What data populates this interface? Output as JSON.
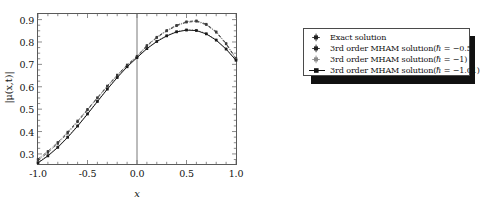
{
  "chart_data": {
    "type": "line",
    "title": "",
    "xlabel": "x",
    "ylabel": "|μ(x,t)|",
    "xlim": [
      -1.0,
      1.0
    ],
    "ylim": [
      0.255,
      0.925
    ],
    "grid": false,
    "legend_position": "right-outside",
    "x_ticks": [
      "-1.0",
      "-0.5",
      "0.0",
      "0.5",
      "1.0"
    ],
    "x_tick_values": [
      -1.0,
      -0.5,
      0.0,
      0.5,
      1.0
    ],
    "y_ticks": [
      "0.3",
      "0.4",
      "0.5",
      "0.6",
      "0.7",
      "0.8",
      "0.9"
    ],
    "y_tick_values": [
      0.3,
      0.4,
      0.5,
      0.6,
      0.7,
      0.8,
      0.9
    ],
    "x": [
      -1.0,
      -0.9,
      -0.8,
      -0.7,
      -0.6,
      -0.5,
      -0.4,
      -0.3,
      -0.2,
      -0.1,
      0.0,
      0.1,
      0.2,
      0.3,
      0.4,
      0.5,
      0.6,
      0.7,
      0.8,
      0.9,
      1.0
    ],
    "series": [
      {
        "name": "Exact solution",
        "marker": "square",
        "line": "dash-dot",
        "color": "#3c3c3c",
        "values": [
          0.277,
          0.312,
          0.352,
          0.398,
          0.448,
          0.5,
          0.552,
          0.604,
          0.653,
          0.698,
          0.737,
          0.785,
          0.822,
          0.852,
          0.875,
          0.891,
          0.895,
          0.88,
          0.846,
          0.794,
          0.727
        ]
      },
      {
        "name": "3rd order MHAM solution(ℏ = −0.5)",
        "marker": "square",
        "line": "dash-dot",
        "color": "#3c3c3c",
        "values": [
          0.271,
          0.306,
          0.346,
          0.392,
          0.443,
          0.496,
          0.549,
          0.601,
          0.65,
          0.695,
          0.734,
          0.782,
          0.819,
          0.849,
          0.872,
          0.888,
          0.892,
          0.877,
          0.843,
          0.791,
          0.724
        ]
      },
      {
        "name": "3rd order MHAM solution(ℏ = −1)",
        "marker": "square",
        "line": "dotted",
        "color": "#6a6a6a",
        "values": [
          0.263,
          0.294,
          0.332,
          0.377,
          0.427,
          0.481,
          0.536,
          0.591,
          0.643,
          0.691,
          0.732,
          0.772,
          0.804,
          0.829,
          0.847,
          0.855,
          0.853,
          0.838,
          0.81,
          0.77,
          0.72
        ]
      },
      {
        "name": "3rd order MHAM solution(ℏ = −1.01)",
        "marker": "square",
        "line": "solid",
        "color": "#1a1a1a",
        "values": [
          0.26,
          0.291,
          0.329,
          0.374,
          0.424,
          0.478,
          0.534,
          0.589,
          0.641,
          0.689,
          0.73,
          0.77,
          0.802,
          0.827,
          0.845,
          0.853,
          0.851,
          0.836,
          0.808,
          0.768,
          0.718
        ]
      }
    ]
  },
  "legend": {
    "items": [
      {
        "label": "Exact solution",
        "mark": "dot-marker"
      },
      {
        "label": "3rd order MHAM solution(ℏ = −0.5)",
        "mark": "dot-marker"
      },
      {
        "label": "3rd order MHAM solution(ℏ = −1)",
        "mark": "dot-marker-light"
      },
      {
        "label": "3rd order MHAM solution(ℏ = −1.01)",
        "mark": "line-marker"
      }
    ]
  },
  "axes": {
    "x_title": "x",
    "y_title": "|μ(x,t)|"
  }
}
